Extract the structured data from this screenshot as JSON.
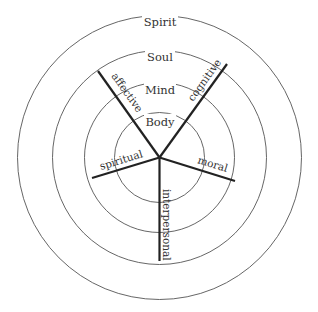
{
  "diagram": {
    "type": "concentric-circles-with-spokes",
    "center": [
      159.5,
      157.5
    ],
    "rings": [
      {
        "label": "Body",
        "radius": 45
      },
      {
        "label": "Mind",
        "radius": 75
      },
      {
        "label": "Soul",
        "radius": 107
      },
      {
        "label": "Spirit",
        "radius": 142
      }
    ],
    "spokes": [
      {
        "label": "affective",
        "end": [
          98,
          71
        ]
      },
      {
        "label": "cognitive",
        "end": [
          227,
          64
        ]
      },
      {
        "label": "spiritual",
        "end": [
          92,
          178
        ]
      },
      {
        "label": "moral",
        "end": [
          235,
          181
        ]
      },
      {
        "label": "interpersonal",
        "end": [
          159.5,
          261
        ]
      }
    ],
    "colors": {
      "ring": "#555555",
      "spoke": "#222222",
      "text": "#333333",
      "background": "#ffffff"
    }
  }
}
